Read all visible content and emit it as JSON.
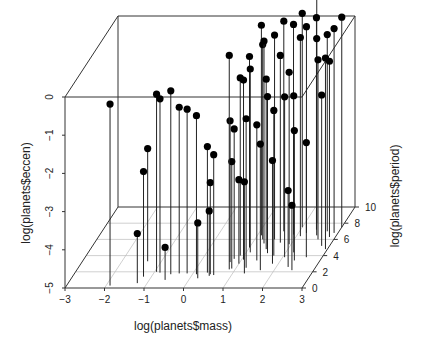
{
  "chart_data": {
    "type": "scatter",
    "subtype": "scatterplot3d (type='h', vertical drop lines)",
    "title": "",
    "xlabel": "log(planets$mass)",
    "ylabel": "log(planets$period)",
    "zlabel": "log(planets$eccen)",
    "xlim": [
      -3,
      3
    ],
    "ylim": [
      0,
      10
    ],
    "zlim": [
      -5,
      0
    ],
    "x_ticks": [
      "-3",
      "-2",
      "-1",
      "0",
      "1",
      "2",
      "3"
    ],
    "y_ticks": [
      "0",
      "2",
      "4",
      "6",
      "8",
      "10"
    ],
    "z_ticks": [
      "-5",
      "-4",
      "-3",
      "-2",
      "-1",
      "0"
    ],
    "grid": "xy-plane grid on floor",
    "point_color": "#000000",
    "points_note": "approximate; each point [mass, period, eccen] in log units",
    "points": [
      [
        -1.9,
        0.3,
        -0.25
      ],
      [
        -1.35,
        3.3,
        -2.05
      ],
      [
        -1.25,
        0.6,
        -3.7
      ],
      [
        -0.95,
        2.0,
        -0.35
      ],
      [
        -0.85,
        1.9,
        -0.45
      ],
      [
        -1.2,
        1.4,
        -2.25
      ],
      [
        -0.55,
        1.7,
        -0.2
      ],
      [
        -0.6,
        1.0,
        -4.15
      ],
      [
        -0.35,
        1.8,
        -0.65
      ],
      [
        -0.15,
        1.8,
        -0.7
      ],
      [
        0.1,
        1.7,
        -0.85
      ],
      [
        0.35,
        1.9,
        -1.7
      ],
      [
        0.45,
        1.7,
        -2.6
      ],
      [
        0.45,
        1.5,
        -3.3
      ],
      [
        0.2,
        1.2,
        -3.55
      ],
      [
        0.55,
        1.6,
        -1.85
      ],
      [
        0.85,
        2.3,
        0.6
      ],
      [
        0.9,
        4.0,
        -0.35
      ],
      [
        1.0,
        5.0,
        0.0
      ],
      [
        1.05,
        3.5,
        -0.3
      ],
      [
        1.1,
        4.4,
        -0.2
      ],
      [
        1.2,
        6.0,
        0.1
      ],
      [
        1.1,
        6.5,
        0.5
      ],
      [
        1.3,
        5.5,
        0.3
      ],
      [
        0.75,
        3.2,
        -1.3
      ],
      [
        0.8,
        3.6,
        -1.6
      ],
      [
        0.9,
        2.4,
        -2.2
      ],
      [
        1.0,
        3.0,
        -2.8
      ],
      [
        1.25,
        2.5,
        -1.1
      ],
      [
        1.4,
        3.4,
        -1.45
      ],
      [
        1.5,
        6.0,
        0.35
      ],
      [
        1.6,
        7.0,
        0.5
      ],
      [
        1.7,
        5.6,
        -0.1
      ],
      [
        1.45,
        4.8,
        -0.55
      ],
      [
        1.55,
        4.3,
        -0.9
      ],
      [
        1.75,
        4.0,
        -1.2
      ],
      [
        1.9,
        6.6,
        0.5
      ],
      [
        2.0,
        7.5,
        0.6
      ],
      [
        2.1,
        6.4,
        0.2
      ],
      [
        2.2,
        6.8,
        0.4
      ],
      [
        1.95,
        5.4,
        -0.5
      ],
      [
        2.05,
        3.8,
        -0.8
      ],
      [
        2.3,
        8.0,
        0.95
      ],
      [
        2.4,
        7.2,
        0.55
      ],
      [
        2.2,
        4.4,
        -0.9
      ],
      [
        2.5,
        6.5,
        0.15
      ],
      [
        2.6,
        6.0,
        -0.3
      ],
      [
        2.7,
        7.0,
        0.15
      ],
      [
        2.35,
        3.4,
        -1.6
      ],
      [
        2.6,
        3.8,
        -2.0
      ],
      [
        2.8,
        5.2,
        -1.05
      ],
      [
        2.85,
        6.3,
        -0.4
      ],
      [
        2.3,
        2.6,
        -3.0
      ],
      [
        2.45,
        2.2,
        -3.3
      ],
      [
        1.85,
        3.0,
        -2.3
      ],
      [
        1.3,
        1.8,
        -2.6
      ],
      [
        2.9,
        6.8,
        0.35
      ],
      [
        3.0,
        7.5,
        0.5
      ],
      [
        2.95,
        4.8,
        0.0
      ],
      [
        1.65,
        2.2,
        -1.7
      ]
    ]
  }
}
